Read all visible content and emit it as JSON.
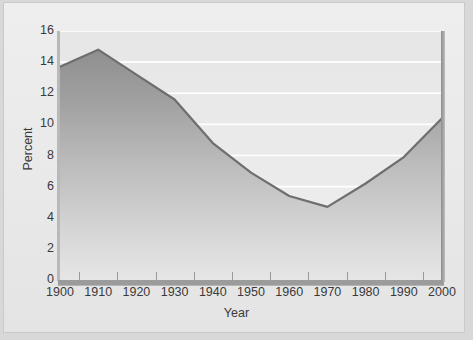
{
  "figure": {
    "background_color": "#ececec",
    "panel_border_color": "#c9c9c9",
    "axis_color": "#9b9b9b",
    "line_color": "#6e6e6e",
    "fill_top_color": "#9a9a9a",
    "fill_bottom_color": "#e2e2e2",
    "gridline_color": "#ffffff"
  },
  "chart_data": {
    "type": "area",
    "title": "",
    "subtitle": "",
    "xlabel": "Year",
    "ylabel": "Percent",
    "x": [
      1900,
      1910,
      1920,
      1930,
      1940,
      1950,
      1960,
      1970,
      1980,
      1990,
      2000
    ],
    "values": [
      13.7,
      14.8,
      13.2,
      11.6,
      8.8,
      6.9,
      5.4,
      4.7,
      6.2,
      7.9,
      10.4
    ],
    "categories": [
      "1900",
      "1910",
      "1920",
      "1930",
      "1940",
      "1950",
      "1960",
      "1970",
      "1980",
      "1990",
      "2000"
    ],
    "xtick_labels": [
      "1900",
      "1910",
      "1920",
      "1930",
      "1940",
      "1950",
      "1960",
      "1970",
      "1980",
      "1990",
      "2000"
    ],
    "ytick_labels": [
      "0",
      "2",
      "4",
      "6",
      "8",
      "10",
      "12",
      "14",
      "16"
    ],
    "ytick_values": [
      0,
      2,
      4,
      6,
      8,
      10,
      12,
      14,
      16
    ],
    "xlim": [
      1900,
      2000
    ],
    "ylim": [
      0,
      16
    ],
    "grid": true,
    "grid_axis": "y",
    "legend": false,
    "legend_position": "none",
    "series": [
      {
        "name": "Percent",
        "values": [
          13.7,
          14.8,
          13.2,
          11.6,
          8.8,
          6.9,
          5.4,
          4.7,
          6.2,
          7.9,
          10.4
        ]
      }
    ],
    "annotations": []
  }
}
